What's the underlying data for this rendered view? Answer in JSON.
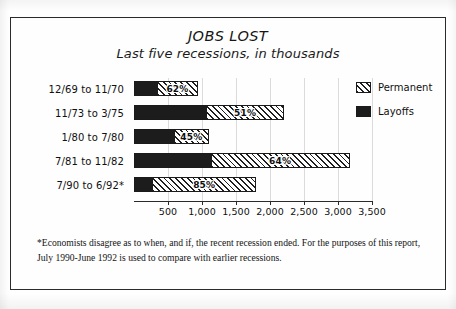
{
  "figure": {
    "title": "JOBS LOST",
    "subtitle": "Last five recessions, in thousands",
    "footnote": "*Economists disagree as to when, and if, the recent recession ended. For the purposes of this report, July 1990-June 1992 is used to compare with earlier recessions."
  },
  "legend": {
    "items": [
      {
        "label": "Permanent",
        "swatch": "hatched-diagonal",
        "color": "#1f1f1f"
      },
      {
        "label": "Layoffs",
        "swatch": "solid-black",
        "color": "#1c1c1c"
      }
    ]
  },
  "chart_data": {
    "type": "bar",
    "orientation": "horizontal",
    "stacked": true,
    "title": "JOBS LOST",
    "subtitle": "Last five recessions, in thousands",
    "xlabel": "",
    "ylabel": "",
    "xlim": [
      0,
      3500
    ],
    "xticks": [
      500,
      1000,
      1500,
      2000,
      2500,
      3000,
      3500
    ],
    "xticklabels": [
      "500",
      "1,000",
      "1,500",
      "2,000",
      "2,500",
      "3,000",
      "3,500"
    ],
    "grid": true,
    "legend_position": "right",
    "units": "thousands of jobs",
    "categories": [
      "12/69 to 11/70",
      "11/73 to 3/75",
      "1/80 to 7/80",
      "7/81 to 11/82",
      "7/90 to 6/92*"
    ],
    "series": [
      {
        "name": "Layoffs",
        "values": [
          355,
          1080,
          605,
          1140,
          270
        ]
      },
      {
        "name": "Permanent",
        "values": [
          580,
          1125,
          495,
          2030,
          1530
        ]
      }
    ],
    "totals": [
      935,
      2205,
      1100,
      3170,
      1800
    ],
    "data_labels": [
      "62%",
      "51%",
      "45%",
      "64%",
      "85%"
    ],
    "data_label_meaning": "share of job losses that were permanent",
    "bars": [
      {
        "category": "12/69 to 11/70",
        "layoffs": 355,
        "permanent": 580,
        "total": 935,
        "permanent_pct": "62%"
      },
      {
        "category": "11/73 to 3/75",
        "layoffs": 1080,
        "permanent": 1125,
        "total": 2205,
        "permanent_pct": "51%"
      },
      {
        "category": "1/80 to 7/80",
        "layoffs": 605,
        "permanent": 495,
        "total": 1100,
        "permanent_pct": "45%"
      },
      {
        "category": "7/81 to 11/82",
        "layoffs": 1140,
        "permanent": 2030,
        "total": 3170,
        "permanent_pct": "64%"
      },
      {
        "category": "7/90 to 6/92*",
        "layoffs": 270,
        "permanent": 1530,
        "total": 1800,
        "permanent_pct": "85%"
      }
    ]
  }
}
